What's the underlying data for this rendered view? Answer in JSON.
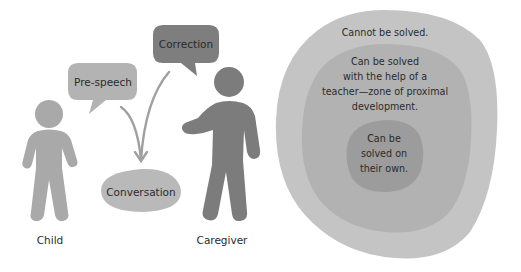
{
  "colors": {
    "background": "#ffffff",
    "child_figure": "#a9a9a9",
    "caregiver_figure": "#7c7c7c",
    "prespeech_bubble": "#b3b3b3",
    "correction_bubble": "#7e7e7e",
    "conversation_bubble": "#b9b9b9",
    "arrow": "#a0a0a0",
    "zone_outer": "#c4c4c4",
    "zone_middle": "#b2b2b2",
    "zone_inner": "#9c9c9c",
    "text": "#2b2b2b"
  },
  "left_diagram": {
    "figures": {
      "child_label": "Child",
      "caregiver_label": "Caregiver"
    },
    "bubbles": {
      "prespeech": "Pre-speech",
      "correction": "Correction",
      "conversation": "Conversation"
    }
  },
  "right_diagram": {
    "outer_zone": {
      "lines": [
        "Cannot be solved."
      ]
    },
    "middle_zone": {
      "lines": [
        "Can be solved",
        "with the help of a",
        "teacher—zone of proximal",
        "development."
      ]
    },
    "inner_zone": {
      "lines": [
        "Can be",
        "solved on",
        "their own."
      ]
    }
  }
}
